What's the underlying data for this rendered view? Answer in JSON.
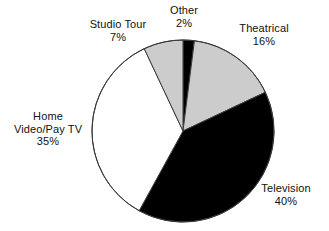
{
  "chart_data": {
    "type": "pie",
    "title": "",
    "subtitle": "",
    "xlabel": "",
    "ylabel": "",
    "legend_position": "none",
    "grid": false,
    "labels_outside": true,
    "start_angle_deg": 0,
    "direction": "clockwise",
    "categories": [
      "Other",
      "Theatrical",
      "Television",
      "Home Video/Pay TV",
      "Studio Tour"
    ],
    "values": [
      2,
      16,
      40,
      35,
      7
    ],
    "value_unit": "%",
    "slices": [
      {
        "name": "Other",
        "label_lines": [
          "Other"
        ],
        "value": 2,
        "value_text": "2%",
        "fill": "#000000",
        "stroke": "#3a3a3a"
      },
      {
        "name": "Theatrical",
        "label_lines": [
          "Theatrical"
        ],
        "value": 16,
        "value_text": "16%",
        "fill": "#cccccc",
        "stroke": "#3a3a3a"
      },
      {
        "name": "Television",
        "label_lines": [
          "Television"
        ],
        "value": 40,
        "value_text": "40%",
        "fill": "#000000",
        "stroke": "#3a3a3a"
      },
      {
        "name": "Home Video/Pay TV",
        "label_lines": [
          "Home",
          "Video/Pay TV"
        ],
        "value": 35,
        "value_text": "35%",
        "fill": "#ffffff",
        "stroke": "#3a3a3a"
      },
      {
        "name": "Studio Tour",
        "label_lines": [
          "Studio Tour"
        ],
        "value": 7,
        "value_text": "7%",
        "fill": "#cccccc",
        "stroke": "#3a3a3a"
      }
    ],
    "geometry": {
      "center_x": 183,
      "center_y": 131,
      "radius": 91
    },
    "colors": {
      "background": "#ffffff",
      "black_fill": "#000000",
      "gray_fill": "#cccccc",
      "white_fill": "#ffffff",
      "outline": "#3a3a3a",
      "text": "#111111"
    }
  }
}
